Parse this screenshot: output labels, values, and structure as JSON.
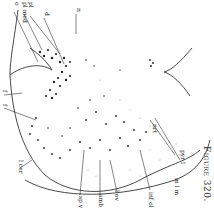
{
  "figure": {
    "caption": "Figure 320.",
    "ink_color": "#222222",
    "labels": {
      "top": [
        {
          "id": "o",
          "text": "o"
        },
        {
          "id": "pl-med",
          "text": "pl med"
        },
        {
          "id": "pl",
          "text": "pl"
        },
        {
          "id": "d",
          "text": "d"
        },
        {
          "id": "n",
          "text": "n"
        }
      ],
      "left": [
        {
          "id": "f1",
          "text": "f"
        },
        {
          "id": "f2",
          "text": "f"
        },
        {
          "id": "l-cer",
          "text": "l cer"
        }
      ],
      "bottom": [
        {
          "id": "sp-v",
          "text": "sp v"
        },
        {
          "id": "amb",
          "text": "amb"
        },
        {
          "id": "l-ov",
          "text": "l ov"
        },
        {
          "id": "inf-ol",
          "text": "inf ol"
        }
      ],
      "right": [
        {
          "id": "pyr-l",
          "text": "pyr l"
        },
        {
          "id": "m-lem",
          "text": "m l m"
        },
        {
          "id": "nrt",
          "text": "nrt"
        }
      ]
    }
  }
}
